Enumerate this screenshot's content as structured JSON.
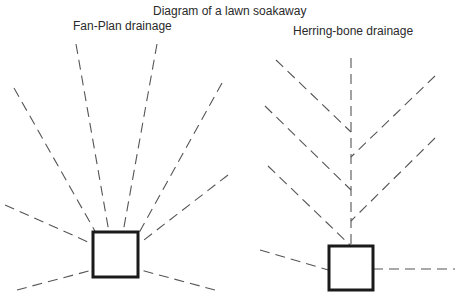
{
  "title": "Diagram of a lawn soakaway",
  "diagrams": [
    {
      "label": "Fan-Plan drainage",
      "soakaway": {
        "x": 93,
        "y": 232,
        "w": 45,
        "h": 45
      },
      "drains": [
        [
          5,
          205,
          97,
          246
        ],
        [
          14,
          88,
          100,
          240
        ],
        [
          76,
          44,
          110,
          238
        ],
        [
          157,
          44,
          122,
          238
        ],
        [
          222,
          83,
          135,
          240
        ],
        [
          228,
          175,
          140,
          243
        ],
        [
          17,
          290,
          100,
          268
        ],
        [
          215,
          290,
          133,
          268
        ]
      ]
    },
    {
      "label": "Herring-bone drainage",
      "soakaway": {
        "x": 329,
        "y": 246,
        "w": 44,
        "h": 44
      },
      "drains": [
        [
          351,
          58,
          351,
          252
        ],
        [
          276,
          60,
          351,
          132
        ],
        [
          435,
          76,
          351,
          157
        ],
        [
          265,
          106,
          351,
          190
        ],
        [
          435,
          138,
          351,
          221
        ],
        [
          268,
          166,
          351,
          246
        ],
        [
          260,
          250,
          332,
          271
        ],
        [
          373,
          269,
          455,
          269
        ]
      ]
    }
  ],
  "colors": {
    "drain": "#555555",
    "soakaway": "#1a1a1a",
    "background": "#ffffff"
  }
}
